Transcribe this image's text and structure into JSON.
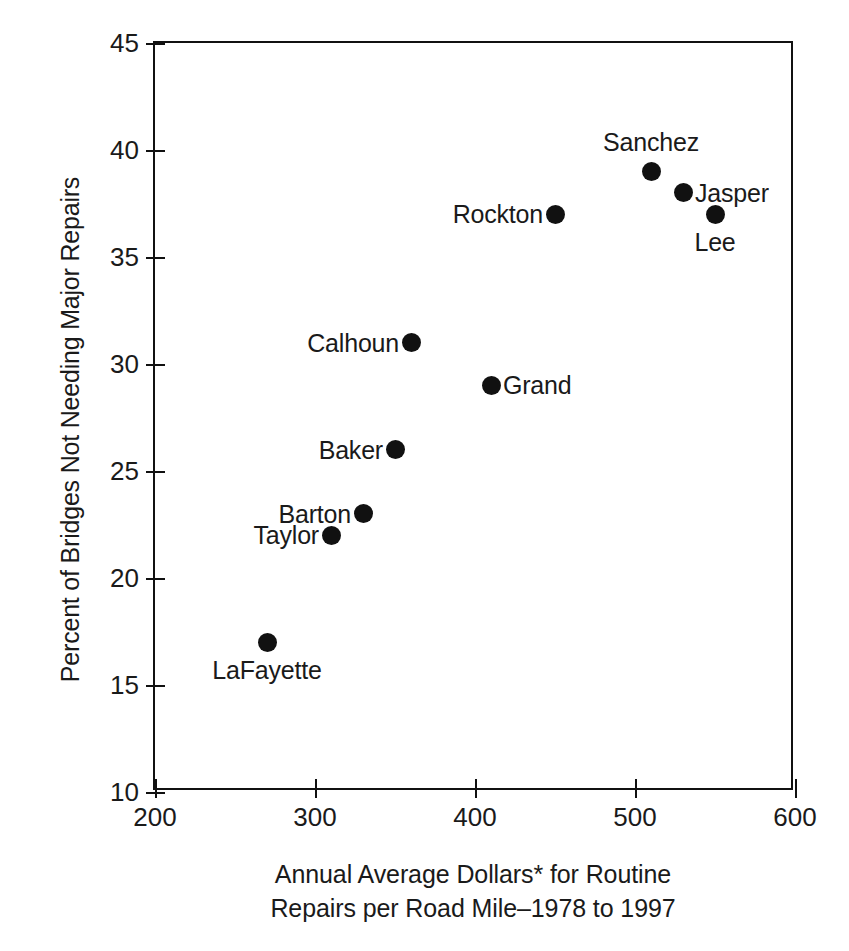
{
  "chart_data": {
    "type": "scatter",
    "title": "",
    "xlabel": "Annual Average Dollars* for Routine Repairs per Road Mile–1978 to 1997",
    "xlabel_line1": "Annual Average Dollars* for Routine",
    "xlabel_line2": "Repairs per Road Mile–1978 to 1997",
    "ylabel": "Percent of Bridges Not Needing Major Repairs",
    "xlim": [
      200,
      600
    ],
    "ylim": [
      10,
      45
    ],
    "xticks": [
      "200",
      "300",
      "400",
      "500",
      "600"
    ],
    "yticks": [
      "10",
      "15",
      "20",
      "25",
      "30",
      "35",
      "40",
      "45"
    ],
    "grid": false,
    "legend": "none",
    "marker_color": "#111111",
    "axis_color": "#111111",
    "points": [
      {
        "name": "LaFayette",
        "x": 270,
        "y": 17,
        "label_pos": "below"
      },
      {
        "name": "Taylor",
        "x": 310,
        "y": 22,
        "label_pos": "left"
      },
      {
        "name": "Barton",
        "x": 330,
        "y": 23,
        "label_pos": "left"
      },
      {
        "name": "Baker",
        "x": 350,
        "y": 26,
        "label_pos": "left"
      },
      {
        "name": "Calhoun",
        "x": 360,
        "y": 31,
        "label_pos": "left"
      },
      {
        "name": "Grand",
        "x": 410,
        "y": 29,
        "label_pos": "right"
      },
      {
        "name": "Rockton",
        "x": 450,
        "y": 37,
        "label_pos": "left"
      },
      {
        "name": "Sanchez",
        "x": 510,
        "y": 39,
        "label_pos": "above"
      },
      {
        "name": "Jasper",
        "x": 530,
        "y": 38,
        "label_pos": "right"
      },
      {
        "name": "Lee",
        "x": 550,
        "y": 37,
        "label_pos": "below"
      }
    ]
  }
}
